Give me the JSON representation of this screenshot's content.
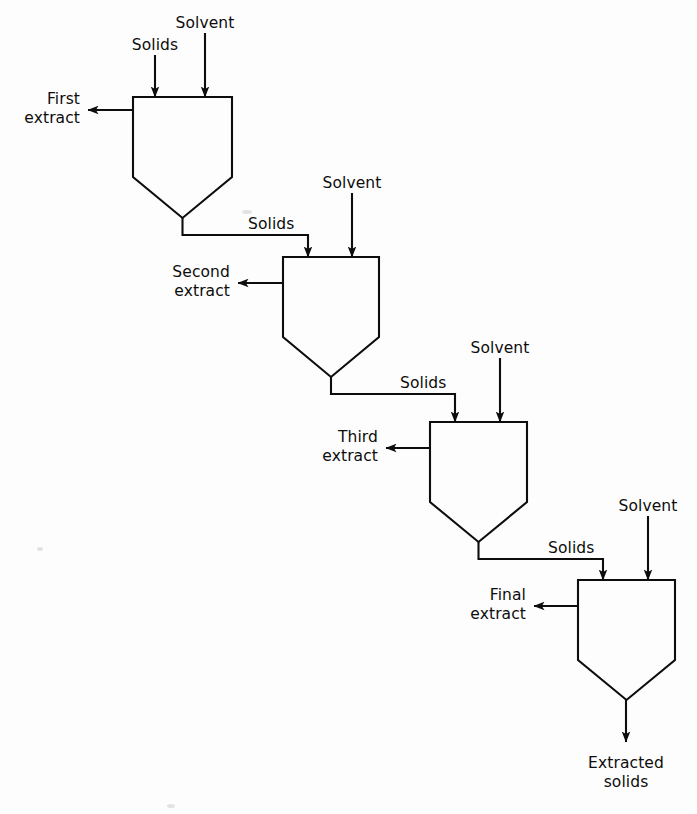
{
  "diagram": {
    "type": "process-flow-diagram",
    "background_color": "#fdfdfd",
    "line_color": "#0d0d0d",
    "stage_count": 4,
    "feed_label": "Solids",
    "solvent_label": "Solvent",
    "interstage_label": "Solids",
    "final_product_label_line1": "Extracted",
    "final_product_label_line2": "solids",
    "stages": [
      {
        "index": 1,
        "extract_label_line1": "First",
        "extract_label_line2": "extract",
        "inlet_left_label": "Solids",
        "inlet_right_label": "Solvent",
        "outlet_label": "Solids",
        "vessel": {
          "left": 133,
          "right": 232,
          "top": 97,
          "shoulder": 177,
          "apex": 218
        },
        "inlet_left_x": 155,
        "inlet_right_x": 205,
        "inlet_top_y_left": 55,
        "inlet_top_y_right": 33,
        "extract_arrow_y": 110,
        "extract_arrow_tip_x": 88,
        "extract_text_x": 80,
        "extract_text_y1": 104,
        "extract_text_y2": 123,
        "inlet_left_text_x": 155,
        "inlet_left_text_y": 50,
        "inlet_right_text_x": 205,
        "inlet_right_text_y": 28,
        "outlet_drop_y": 235,
        "outlet_text_x": 248,
        "outlet_text_y": 229
      },
      {
        "index": 2,
        "extract_label_line1": "Second",
        "extract_label_line2": "extract",
        "inlet_right_label": "Solvent",
        "outlet_label": "Solids",
        "vessel": {
          "left": 283,
          "right": 379,
          "top": 257,
          "shoulder": 337,
          "apex": 377
        },
        "inlet_left_x": 308,
        "inlet_right_x": 352,
        "inlet_right_top_y": 193,
        "extract_arrow_y": 283,
        "extract_arrow_tip_x": 238,
        "extract_text_x": 230,
        "extract_text_y1": 277,
        "extract_text_y2": 296,
        "inlet_right_text_x": 352,
        "inlet_right_text_y": 188,
        "outlet_drop_y": 394,
        "outlet_text_x": 400,
        "outlet_text_y": 388
      },
      {
        "index": 3,
        "extract_label_line1": "Third",
        "extract_label_line2": "extract",
        "inlet_right_label": "Solvent",
        "outlet_label": "Solids",
        "vessel": {
          "left": 430,
          "right": 527,
          "top": 422,
          "shoulder": 502,
          "apex": 542
        },
        "inlet_left_x": 455,
        "inlet_right_x": 500,
        "inlet_right_top_y": 358,
        "extract_arrow_y": 448,
        "extract_arrow_tip_x": 386,
        "extract_text_x": 378,
        "extract_text_y1": 442,
        "extract_text_y2": 461,
        "inlet_right_text_x": 500,
        "inlet_right_text_y": 353,
        "outlet_drop_y": 559,
        "outlet_text_x": 548,
        "outlet_text_y": 553
      },
      {
        "index": 4,
        "extract_label_line1": "Final",
        "extract_label_line2": "extract",
        "inlet_right_label": "Solvent",
        "vessel": {
          "left": 578,
          "right": 675,
          "top": 580,
          "shoulder": 660,
          "apex": 700
        },
        "inlet_left_x": 603,
        "inlet_right_x": 648,
        "inlet_right_top_y": 516,
        "extract_arrow_y": 606,
        "extract_arrow_tip_x": 534,
        "extract_text_x": 526,
        "extract_text_y1": 600,
        "extract_text_y2": 619,
        "inlet_right_text_x": 648,
        "inlet_right_text_y": 511,
        "final_outlet_x": 626,
        "final_outlet_tip_y": 742,
        "final_text_x": 626,
        "final_text_y1": 768,
        "final_text_y2": 787
      }
    ]
  }
}
